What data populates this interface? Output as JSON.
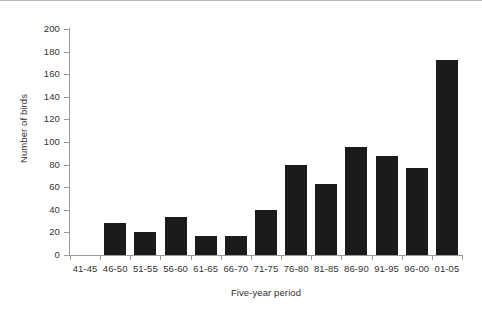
{
  "chart_data": {
    "type": "bar",
    "title": "",
    "xlabel": "Five-year period",
    "ylabel": "Number of birds",
    "categories": [
      "41-45",
      "46-50",
      "51-55",
      "56-60",
      "61-65",
      "66-70",
      "71-75",
      "76-80",
      "81-85",
      "86-90",
      "91-95",
      "96-00",
      "01-05"
    ],
    "values": [
      0,
      28,
      20,
      34,
      17,
      17,
      40,
      80,
      63,
      96,
      88,
      77,
      173
    ],
    "ylim": [
      0,
      200
    ],
    "ytick_values": [
      0,
      20,
      40,
      60,
      80,
      100,
      120,
      140,
      160,
      180,
      200
    ],
    "ytick_labels": [
      "0",
      "20",
      "40",
      "60",
      "80",
      "100",
      "120",
      "140",
      "160",
      "180",
      "200"
    ],
    "grid": false,
    "legend": null,
    "bar_color": "#1b1b1b",
    "axis_color": "#9a9a9a",
    "text_color": "#333333",
    "background": "#ffffff"
  }
}
